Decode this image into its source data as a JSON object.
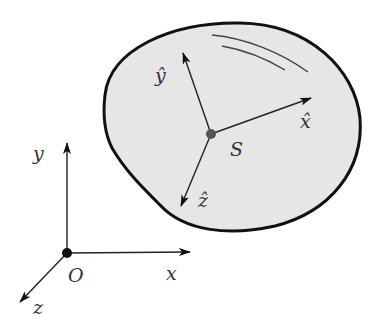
{
  "diagram": {
    "title": "",
    "world_frame": {
      "origin_label": "O",
      "axes": [
        {
          "name": "x",
          "label": "x"
        },
        {
          "name": "y",
          "label": "y"
        },
        {
          "name": "z",
          "label": "z"
        }
      ]
    },
    "body": {
      "point_label": "S",
      "fill": "#e6e6e6",
      "outline": "#111111",
      "axes": [
        {
          "name": "x-hat",
          "label": "x̂"
        },
        {
          "name": "y-hat",
          "label": "ŷ"
        },
        {
          "name": "z-hat",
          "label": "ẑ"
        }
      ]
    },
    "colors": {
      "line": "#222222",
      "point": "#555555"
    }
  }
}
